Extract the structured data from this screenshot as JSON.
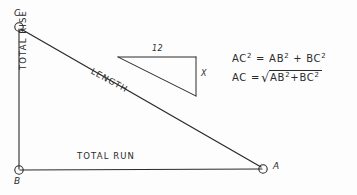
{
  "diagram": {
    "background_color": "#fdfdfd",
    "ink_color": "#2b2b2b",
    "vertices": [
      {
        "id": "C",
        "label": "C",
        "x": 19,
        "y": 27
      },
      {
        "id": "B",
        "label": "B",
        "x": 19,
        "y": 170
      },
      {
        "id": "A",
        "label": "A",
        "x": 263,
        "y": 169
      }
    ],
    "edges": [
      {
        "id": "rise",
        "label": "TOTAL RISE",
        "from": "C",
        "to": "B"
      },
      {
        "id": "run",
        "label": "TOTAL RUN",
        "from": "B",
        "to": "A"
      },
      {
        "id": "length",
        "label": "LENGTH",
        "from": "C",
        "to": "A"
      }
    ],
    "inset_triangle": {
      "top_label": "12",
      "side_label": "X",
      "top_left": {
        "x": 118,
        "y": 57
      },
      "top_right": {
        "x": 196,
        "y": 57
      },
      "bottom_right": {
        "x": 196,
        "y": 96
      }
    },
    "formulas": [
      {
        "id": "pythagorean-squared",
        "lhs": "AC",
        "lhs_exp": "2",
        "eq": "=",
        "rhs_a": "AB",
        "rhs_a_exp": "2",
        "plus": "+",
        "rhs_b": "BC",
        "rhs_b_exp": "2"
      },
      {
        "id": "pythagorean-root",
        "lhs": "AC",
        "eq": "=",
        "sqrt": "√",
        "rhs_a": "AB",
        "rhs_a_exp": "2",
        "plus": "+",
        "rhs_b": "BC",
        "rhs_b_exp": "2"
      }
    ]
  }
}
